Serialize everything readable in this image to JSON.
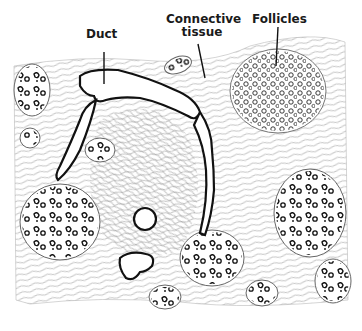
{
  "diagram": {
    "labels": [
      {
        "id": "duct",
        "text": "Duct"
      },
      {
        "id": "connective",
        "text_line1": "Connective",
        "text_line2": "tissue"
      },
      {
        "id": "follicles",
        "text": "Follicles"
      }
    ],
    "colors": {
      "ink": "#1a1a1a",
      "background": "#ffffff",
      "fiber": "#8a8a8a"
    }
  }
}
